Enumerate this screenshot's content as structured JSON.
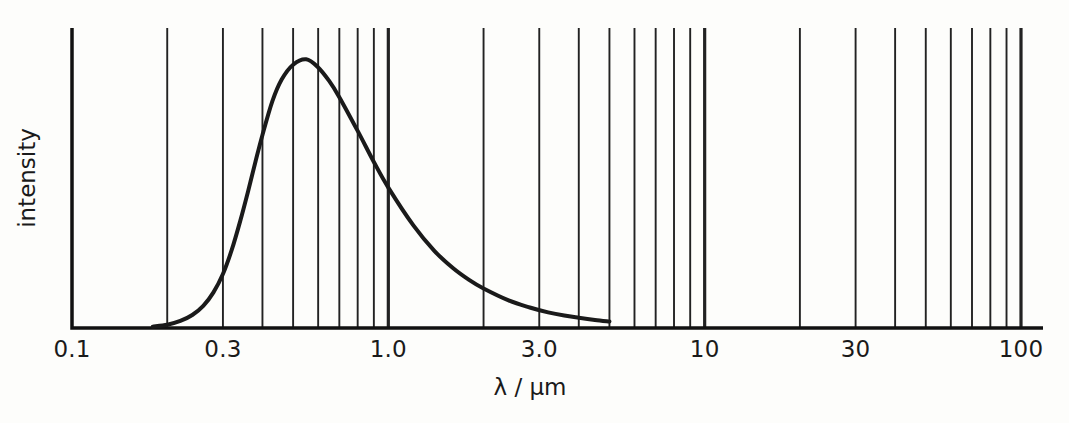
{
  "chart_data": {
    "type": "line",
    "title": "",
    "xlabel": "λ / µm",
    "ylabel": "intensity",
    "xscale": "log",
    "yscale": "linear",
    "xlim": [
      0.1,
      100
    ],
    "ylim": [
      0,
      1
    ],
    "grid": true,
    "grid_axis": "x",
    "legend": "none",
    "x_tick_labels": [
      {
        "value": 0.1,
        "label": "0.1"
      },
      {
        "value": 0.3,
        "label": "0.3"
      },
      {
        "value": 1.0,
        "label": "1.0"
      },
      {
        "value": 3.0,
        "label": "3.0"
      },
      {
        "value": 10,
        "label": "10"
      },
      {
        "value": 30,
        "label": "30"
      },
      {
        "value": 100,
        "label": "100"
      }
    ],
    "y_tick_labels": [],
    "x_gridlines_major": [
      0.1,
      1,
      10,
      100
    ],
    "x_gridlines_minor": [
      0.2,
      0.3,
      0.4,
      0.5,
      0.6,
      0.7,
      0.8,
      0.9,
      2,
      3,
      4,
      5,
      6,
      7,
      8,
      9,
      20,
      30,
      40,
      50,
      60,
      70,
      80,
      90
    ],
    "series": [
      {
        "name": "intensity",
        "color": "#1a1a1a",
        "linewidth": 4,
        "x": [
          0.18,
          0.2,
          0.22,
          0.24,
          0.26,
          0.28,
          0.3,
          0.32,
          0.34,
          0.36,
          0.38,
          0.4,
          0.43,
          0.46,
          0.5,
          0.55,
          0.6,
          0.65,
          0.7,
          0.8,
          0.9,
          1.0,
          1.2,
          1.4,
          1.6,
          1.8,
          2.0,
          2.4,
          2.8,
          3.2,
          3.6,
          4.0,
          4.5,
          5.0
        ],
        "y": [
          0.005,
          0.012,
          0.026,
          0.048,
          0.082,
          0.132,
          0.2,
          0.29,
          0.395,
          0.505,
          0.615,
          0.715,
          0.84,
          0.92,
          0.975,
          0.995,
          0.965,
          0.915,
          0.855,
          0.73,
          0.615,
          0.52,
          0.38,
          0.285,
          0.222,
          0.178,
          0.146,
          0.102,
          0.076,
          0.058,
          0.046,
          0.038,
          0.03,
          0.024
        ]
      }
    ]
  },
  "axis": {
    "frame_color": "#111111",
    "curve_color": "#1a1a1a",
    "gridline_color": "#222222",
    "background": "#fdfdfb"
  }
}
